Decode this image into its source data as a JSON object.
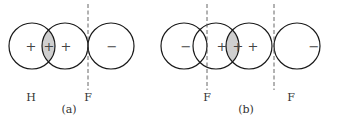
{
  "panel_a": {
    "caption": "(a)",
    "atom_left_label": "H",
    "atom_right_label": "F",
    "lobes": [
      {
        "sign": "+"
      },
      {
        "sign": "+"
      },
      {
        "sign": "+"
      },
      {
        "sign": "−"
      }
    ]
  },
  "panel_b": {
    "caption": "(b)",
    "left_atom_label": "F",
    "right_atom_label": "F",
    "lobes": [
      {
        "sign": "−"
      },
      {
        "sign": "+"
      },
      {
        "sign": "+"
      },
      {
        "sign": "+"
      },
      {
        "sign": "−"
      }
    ]
  },
  "colors": {
    "stroke": "#1a1a1a",
    "overlap_fill": "#cfcfcf",
    "dash": "#555555"
  }
}
